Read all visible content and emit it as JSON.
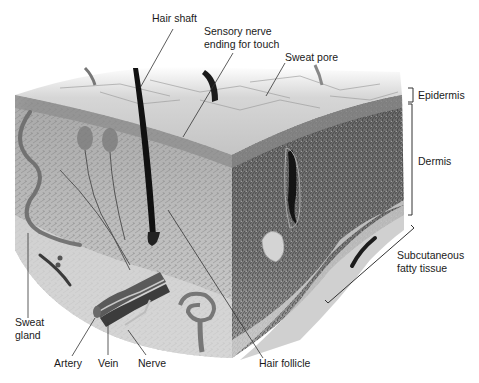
{
  "diagram": {
    "style": "grayscale anatomical illustration",
    "labels": {
      "hair_shaft": "Hair shaft",
      "sensory_nerve": "Sensory nerve\nending for touch",
      "sweat_pore": "Sweat pore",
      "epidermis": "Epidermis",
      "dermis": "Dermis",
      "subcutaneous": "Subcutaneous\nfatty tissue",
      "sweat_gland": "Sweat\ngland",
      "artery": "Artery",
      "vein": "Vein",
      "nerve": "Nerve",
      "hair_follicle": "Hair follicle"
    },
    "layers": [
      "Epidermis",
      "Dermis",
      "Subcutaneous fatty tissue"
    ],
    "colors": {
      "background": "#ffffff",
      "label_text": "#1a1a1a",
      "leader_line": "#333333",
      "surface": "#c9c9c9",
      "dermis_light": "#b5b5b5",
      "dermis_dark": "#5a5a5a",
      "hair": "#111111",
      "vessel": "#6e6e6e"
    }
  }
}
